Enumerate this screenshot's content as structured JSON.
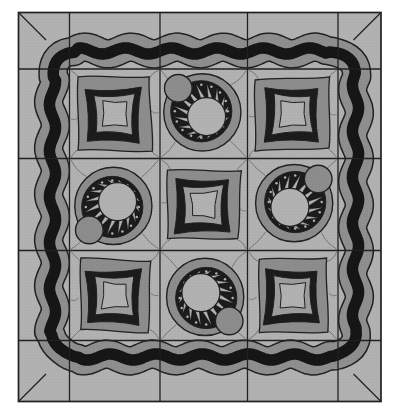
{
  "artwork": {
    "type": "quilt-pattern-illustration",
    "grid_rows": 3,
    "grid_cols": 3,
    "blocks": [
      [
        "pillow-square",
        "sunburst",
        "pillow-square"
      ],
      [
        "sunburst",
        "pillow-square",
        "sunburst"
      ],
      [
        "pillow-square",
        "sunburst",
        "pillow-square"
      ]
    ],
    "sun_knobs": {
      "0-1": "upper-left",
      "1-0": "lower-left",
      "1-2": "upper-right",
      "2-1": "lower-right"
    },
    "sunburst": {
      "ray_count": 16,
      "dot_count": 16
    },
    "border": {
      "style": "wavy",
      "stripe_order": [
        "gray",
        "black",
        "gray"
      ]
    },
    "frame_style": "mitered"
  },
  "palette": {
    "page_bg": "#ffffff",
    "field": "#b2b2b2",
    "medium": "#8d8d8d",
    "ring": "#9e9e9e",
    "dark": "#1a1a1a",
    "band_gray": "#8f8f8f",
    "band_black": "#141414",
    "outline": "#212121",
    "seam": "#2e2e2e"
  }
}
